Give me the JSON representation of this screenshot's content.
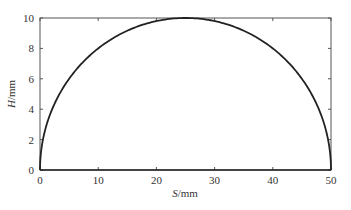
{
  "chart_data": {
    "type": "line",
    "title": "",
    "xlabel": "S/mm",
    "ylabel": "H/mm",
    "xlabel_italic_part": "S",
    "xlabel_unit": "/mm",
    "ylabel_italic_part": "H",
    "ylabel_unit": "/mm",
    "xlim": [
      0,
      50
    ],
    "ylim": [
      0,
      10
    ],
    "xticks": [
      0,
      10,
      20,
      30,
      40,
      50
    ],
    "yticks": [
      0,
      2,
      4,
      6,
      8,
      10
    ],
    "grid": false,
    "legend": null,
    "series": [
      {
        "name": "profile",
        "color": "#222222",
        "x": [
          0,
          1,
          2,
          3,
          4,
          5,
          7.5,
          10,
          12.5,
          15,
          17.5,
          20,
          22.5,
          25,
          27.5,
          30,
          32.5,
          35,
          37.5,
          40,
          42.5,
          45,
          46,
          47,
          48,
          49,
          50
        ],
        "y": [
          0,
          2.8,
          3.92,
          4.75,
          5.43,
          6.0,
          7.14,
          8.0,
          8.66,
          9.17,
          9.54,
          9.8,
          9.95,
          10.0,
          9.95,
          9.8,
          9.54,
          9.17,
          8.66,
          8.0,
          7.14,
          6.0,
          5.43,
          4.75,
          3.92,
          2.8,
          0
        ]
      }
    ]
  }
}
